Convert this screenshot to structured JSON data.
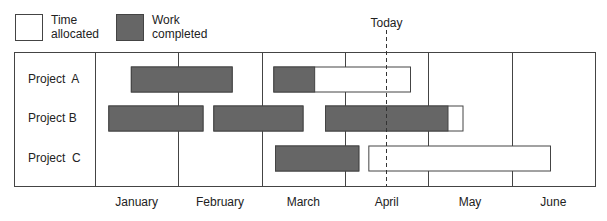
{
  "chart_data": {
    "type": "gantt",
    "title": "",
    "legend": {
      "placement": "top-left",
      "items": [
        {
          "key": "allocated",
          "label_lines": [
            "Time",
            "allocated"
          ],
          "fill": "#ffffff",
          "stroke": "#444444"
        },
        {
          "key": "completed",
          "label_lines": [
            "Work",
            "completed"
          ],
          "fill": "#666666",
          "stroke": "#444444"
        }
      ]
    },
    "x_unit": "months elapsed from start of January",
    "x_range": [
      0,
      6
    ],
    "months": [
      "January",
      "February",
      "March",
      "April",
      "May",
      "June"
    ],
    "today": {
      "label": "Today",
      "value": 3.49
    },
    "projects": [
      {
        "name": "Project  A",
        "tasks": [
          {
            "start": 0.43,
            "end": 1.64,
            "completed_to": 1.64
          },
          {
            "start": 2.14,
            "end": 3.78,
            "completed_to": 2.63
          }
        ]
      },
      {
        "name": "Project B",
        "tasks": [
          {
            "start": 0.16,
            "end": 1.29,
            "completed_to": 1.29
          },
          {
            "start": 1.42,
            "end": 2.49,
            "completed_to": 2.49
          },
          {
            "start": 2.76,
            "end": 4.41,
            "completed_to": 4.23
          }
        ]
      },
      {
        "name": "Project  C",
        "tasks": [
          {
            "start": 2.16,
            "end": 3.16,
            "completed_to": 3.16
          },
          {
            "start": 3.28,
            "end": 5.46,
            "completed_to": 3.28
          }
        ]
      }
    ],
    "colors": {
      "completed": "#666666",
      "allocated": "#ffffff",
      "line": "#444444"
    },
    "grid": true
  }
}
